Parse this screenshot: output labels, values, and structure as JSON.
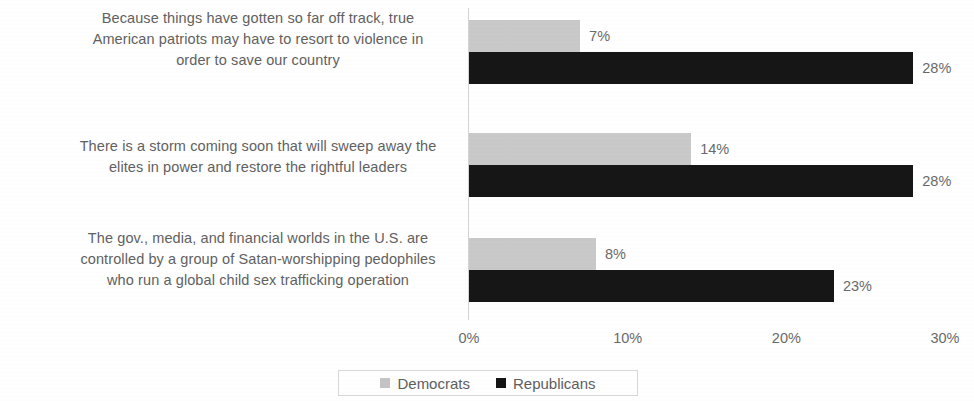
{
  "chart_data": {
    "type": "bar",
    "orientation": "horizontal",
    "title": "",
    "xlabel": "",
    "ylabel": "",
    "xlim": [
      0,
      30
    ],
    "grid": false,
    "legend_position": "bottom",
    "categories": [
      "Because things have gotten so far off track, true\nAmerican patriots may have to resort to violence in\norder to save our country",
      "There is a storm coming soon that will sweep away the\nelites in power and restore the rightful leaders",
      "The gov., media, and financial worlds in the U.S. are\ncontrolled by a group of Satan-worshipping pedophiles\nwho run a global child sex trafficking operation"
    ],
    "series": [
      {
        "name": "Democrats",
        "color": "#c9c9c9",
        "values": [
          7,
          14,
          8
        ],
        "value_labels": [
          "7%",
          "14%",
          "8%"
        ]
      },
      {
        "name": "Republicans",
        "color": "#161616",
        "values": [
          28,
          28,
          23
        ],
        "value_labels": [
          "28%",
          "28%",
          "23%"
        ]
      }
    ],
    "xticks": [
      0,
      10,
      20,
      30
    ],
    "xtick_labels": [
      "0%",
      "10%",
      "20%",
      "30%"
    ]
  },
  "legend": {
    "items": [
      {
        "label": "Democrats",
        "color": "#c4c4c4"
      },
      {
        "label": "Republicans",
        "color": "#141414"
      }
    ]
  }
}
